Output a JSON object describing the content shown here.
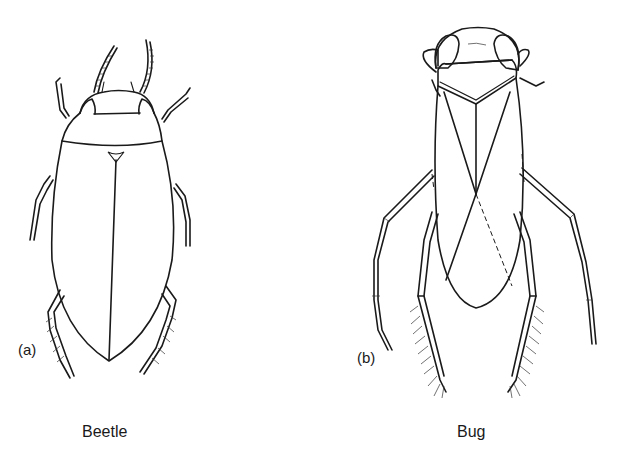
{
  "figure": {
    "panels": [
      {
        "id": "a",
        "tag": "(a)",
        "caption": "Beetle"
      },
      {
        "id": "b",
        "tag": "(b)",
        "caption": "Bug"
      }
    ],
    "colors": {
      "ink": "#1a1a1a",
      "background": "#ffffff"
    }
  }
}
